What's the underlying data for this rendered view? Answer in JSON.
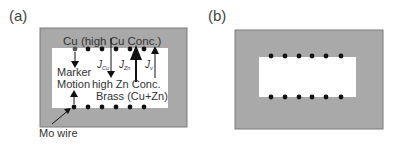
{
  "panels": [
    {
      "label": "(a)",
      "texts": {
        "top": "Cu (high Cu Conc.)",
        "marker": "Marker",
        "motion": "Motion",
        "high_zn": "high Zn Conc.",
        "brass": "Brass (Cu+Zn)",
        "mo_wire": "Mo wire",
        "j_cu": "J",
        "j_cu_sub": "Cu",
        "j_zn": "J",
        "j_zn_sub": "Zn",
        "j_v": "J",
        "j_v_sub": "v"
      }
    },
    {
      "label": "(b)"
    }
  ],
  "colors": {
    "gray_fill": "#a9a9a9",
    "border": "#7a7a7a",
    "inner": "#ffffff",
    "dot": "#111111"
  }
}
